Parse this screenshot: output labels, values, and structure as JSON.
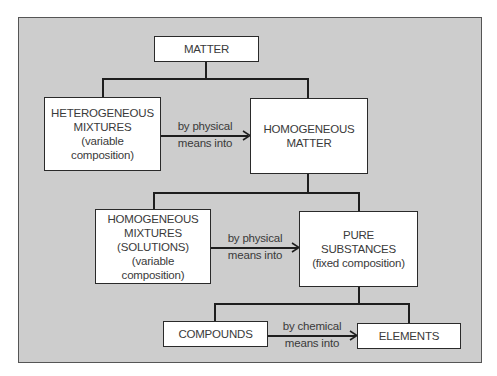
{
  "diagram": {
    "colors": {
      "panel_background": "#cdcdcd",
      "node_background": "#ffffff",
      "line": "#1e1e1e",
      "text": "#3a3a3a"
    },
    "nodes": {
      "matter": {
        "lines": [
          "MATTER"
        ]
      },
      "heterogeneous_mixtures": {
        "lines": [
          "HETEROGENEOUS",
          "MIXTURES",
          "(variable",
          "composition)"
        ]
      },
      "homogeneous_matter": {
        "lines": [
          "HOMOGENEOUS",
          "MATTER"
        ]
      },
      "homogeneous_mixtures": {
        "lines": [
          "HOMOGENEOUS",
          "MIXTURES",
          "(SOLUTIONS)",
          "(variable",
          "composition)"
        ]
      },
      "pure_substances": {
        "lines": [
          "PURE",
          "SUBSTANCES",
          "(fixed composition)"
        ]
      },
      "compounds": {
        "lines": [
          "COMPOUNDS"
        ]
      },
      "elements": {
        "lines": [
          "ELEMENTS"
        ]
      }
    },
    "edges": [
      {
        "from": "matter",
        "to": "heterogeneous_mixtures",
        "type": "branch"
      },
      {
        "from": "matter",
        "to": "homogeneous_matter",
        "type": "branch"
      },
      {
        "from": "heterogeneous_mixtures",
        "to": "homogeneous_matter",
        "type": "arrow",
        "label": [
          "by physical",
          "means into"
        ]
      },
      {
        "from": "homogeneous_matter",
        "to": "homogeneous_mixtures",
        "type": "branch"
      },
      {
        "from": "homogeneous_matter",
        "to": "pure_substances",
        "type": "branch"
      },
      {
        "from": "homogeneous_mixtures",
        "to": "pure_substances",
        "type": "arrow",
        "label": [
          "by physical",
          "means into"
        ]
      },
      {
        "from": "pure_substances",
        "to": "compounds",
        "type": "branch"
      },
      {
        "from": "pure_substances",
        "to": "elements",
        "type": "branch"
      },
      {
        "from": "compounds",
        "to": "elements",
        "type": "arrow",
        "label": [
          "by chemical",
          "means into"
        ]
      }
    ]
  }
}
